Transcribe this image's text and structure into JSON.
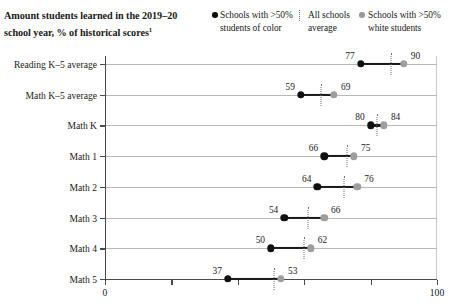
{
  "header": {
    "title_line1": "Amount students learned in the 2019–20",
    "title_line2": "school year, % of historical scores",
    "title_footnote_marker": "1"
  },
  "legend": {
    "items": [
      {
        "label_line1": "Schools with >50%",
        "label_line2": "students of color",
        "marker": "filled-circle-black-icon",
        "color": "#111111"
      },
      {
        "label_line1": "All schools",
        "label_line2": "average",
        "marker": "dotted-vertical-line-icon",
        "color": "#6e6e6e"
      },
      {
        "label_line1": "Schools with >50%",
        "label_line2": "white students",
        "marker": "filled-circle-gray-icon",
        "color": "#9e9e9e"
      }
    ]
  },
  "chart_data": {
    "type": "dot",
    "title": "Amount students learned in the 2019–20 school year, % of historical scores",
    "xlabel": "",
    "ylabel": "",
    "xlim": [
      0,
      100
    ],
    "xticks": [
      0,
      20,
      40,
      60,
      80,
      100
    ],
    "xtick_labels": [
      "0",
      "",
      "",
      "",
      "",
      "100"
    ],
    "grid": true,
    "legend_position": "top-right",
    "categories": [
      "Reading K–5 average",
      "Math K–5 average",
      "Math K",
      "Math 1",
      "Math 2",
      "Math 3",
      "Math 4",
      "Math 5"
    ],
    "series": [
      {
        "name": "Schools with >50% students of color",
        "color": "#111111",
        "values": [
          77,
          59,
          80,
          66,
          64,
          54,
          50,
          37
        ]
      },
      {
        "name": "All schools average",
        "color": "#6e6e6e",
        "values": [
          86,
          65,
          82,
          73,
          72,
          61,
          60,
          51
        ]
      },
      {
        "name": "Schools with >50% white students",
        "color": "#9e9e9e",
        "values": [
          90,
          69,
          84,
          75,
          76,
          66,
          62,
          53
        ]
      }
    ],
    "point_labels": {
      "Reading K–5 average": {
        "left": "77",
        "right": "90"
      },
      "Math K–5 average": {
        "left": "59",
        "right": "69"
      },
      "Math K": {
        "left": "80",
        "right": "84"
      },
      "Math 1": {
        "left": "66",
        "right": "75"
      },
      "Math 2": {
        "left": "64",
        "right": "76"
      },
      "Math 3": {
        "left": "54",
        "right": "66"
      },
      "Math 4": {
        "left": "50",
        "right": "62"
      },
      "Math 5": {
        "left": "37",
        "right": "53"
      }
    }
  }
}
